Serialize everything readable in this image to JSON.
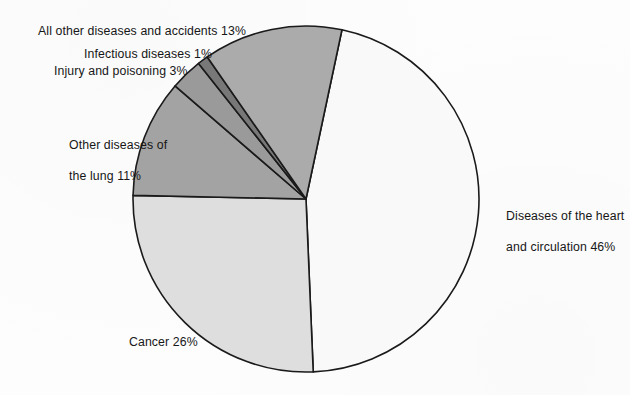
{
  "chart_data": {
    "type": "pie",
    "title": "",
    "subtitle": "",
    "xlabel": "",
    "ylabel": "",
    "legend_position": "none",
    "grid": false,
    "value_unit": "%",
    "total": 100,
    "categories": [
      "Diseases of the heart and circulation",
      "Cancer",
      "Other diseases of the lung",
      "Injury and poisoning",
      "Infectious diseases",
      "All other diseases and accidents"
    ],
    "values": [
      46,
      26,
      11,
      3,
      1,
      13
    ],
    "slices": [
      {
        "name": "Diseases of the heart and circulation",
        "label": "Diseases of the heart\nand circulation 46%",
        "value": 46,
        "color": "#f9f9f9",
        "start_angle": 12,
        "end_angle": 177.6
      },
      {
        "name": "Cancer",
        "label": "Cancer 26%",
        "value": 26,
        "color": "#dedede",
        "start_angle": 177.6,
        "end_angle": 271.2
      },
      {
        "name": "Other diseases of the lung",
        "label": "Other diseases of\nthe lung 11%",
        "value": 11,
        "color": "#a3a3a3",
        "start_angle": 271.2,
        "end_angle": 310.8
      },
      {
        "name": "Injury and poisoning",
        "label": "Injury and poisoning 3%",
        "value": 3,
        "color": "#9a9a9a",
        "start_angle": 310.8,
        "end_angle": 321.6
      },
      {
        "name": "Infectious diseases",
        "label": "Infectious diseases 1%",
        "value": 1,
        "color": "#787878",
        "start_angle": 321.6,
        "end_angle": 325.2
      },
      {
        "name": "All other diseases and accidents",
        "label": "All other diseases and accidents 13%",
        "value": 13,
        "color": "#ababab",
        "start_angle": 325.2,
        "end_angle": 372
      }
    ],
    "geometry": {
      "center_x": 306,
      "center_y": 199,
      "radius": 173
    }
  },
  "labels": {
    "all_other": "All other diseases and accidents 13%",
    "infectious": "Infectious diseases 1%",
    "injury": "Injury and poisoning 3%",
    "lung_line1": "Other diseases of",
    "lung_line2": "the lung 11%",
    "heart_line1": "Diseases of the heart",
    "heart_line2": "and circulation 46%",
    "cancer": "Cancer 26%"
  },
  "colors": {
    "outline": "#1a1a1a",
    "background": "#fdfdfd",
    "text": "#171717",
    "heart_slice": "#f9f9f9",
    "cancer_slice": "#dedede",
    "lung_slice": "#a3a3a3",
    "injury_slice": "#9a9a9a",
    "infectious_slice": "#787878",
    "all_other_slice": "#ababab"
  }
}
